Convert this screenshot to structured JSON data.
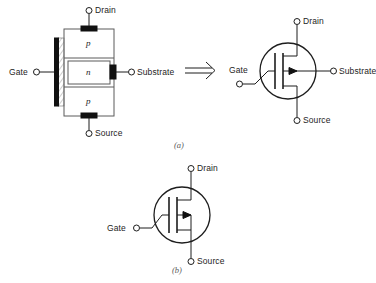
{
  "figure": {
    "part_a_label": "(a)",
    "part_b_label": "(b)",
    "implies_arrow": "double-arrow-right"
  },
  "structure": {
    "caption": "p-channel MOSFET cross-section",
    "terminals": {
      "drain": "Drain",
      "gate": "Gate",
      "substrate": "Substrate",
      "source": "Source"
    },
    "regions": [
      {
        "type": "p",
        "label": "p",
        "position": "top"
      },
      {
        "type": "n",
        "label": "n",
        "position": "middle"
      },
      {
        "type": "p",
        "label": "p",
        "position": "bottom"
      }
    ],
    "gate_layer": "oxide-hatched-insulator",
    "contacts": "black-metal-contacts"
  },
  "symbol_a": {
    "caption": "MOSFET symbol with substrate terminal",
    "terminals": {
      "drain": "Drain",
      "gate": "Gate",
      "substrate": "Substrate",
      "source": "Source"
    },
    "arrow_direction": "inward",
    "enclosure": "circle"
  },
  "symbol_b": {
    "caption": "MOSFET symbol with substrate tied to source",
    "terminals": {
      "drain": "Drain",
      "gate": "Gate",
      "source": "Source"
    },
    "arrow_direction": "inward",
    "enclosure": "circle"
  },
  "colors": {
    "ink": "#1d1d1d",
    "contact": "#111111",
    "outline": "#5b5b5b",
    "background": "#ffffff"
  }
}
